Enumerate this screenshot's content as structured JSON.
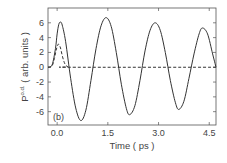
{
  "chart_data": {
    "type": "line",
    "title": "",
    "panel_label": "(b)",
    "xlabel": "Time ( ps )",
    "ylabel": "P",
    "ylabel_superscript": "o.d.",
    "ylabel_suffix": " ( arb. units )",
    "xlim": [
      -0.27,
      4.7
    ],
    "ylim": [
      -7.8,
      8.0
    ],
    "xticks": [
      0.0,
      1.5,
      3.0,
      4.5
    ],
    "xtick_labels": [
      "0.0",
      "1.5",
      "3.0",
      "4.5"
    ],
    "yticks": [
      6,
      4,
      2,
      0,
      -2,
      -4,
      -6
    ],
    "ytick_labels": [
      "6",
      "4",
      "2",
      "0",
      "-2",
      "-4",
      "-6"
    ],
    "grid": false,
    "legend": null,
    "series": [
      {
        "name": "solid",
        "style": "solid",
        "x": [
          -0.27,
          -0.15,
          -0.05,
          0.0,
          0.05,
          0.1,
          0.15,
          0.25,
          0.4,
          0.55,
          0.7,
          0.85,
          1.0,
          1.15,
          1.3,
          1.45,
          1.6,
          1.75,
          1.9,
          2.05,
          2.15,
          2.3,
          2.45,
          2.6,
          2.75,
          2.9,
          3.05,
          3.2,
          3.35,
          3.5,
          3.6,
          3.75,
          3.9,
          4.05,
          4.2,
          4.3,
          4.45,
          4.6,
          4.7
        ],
        "y": [
          0.0,
          0.3,
          2.5,
          4.5,
          5.8,
          6.1,
          5.7,
          3.5,
          -1.5,
          -5.5,
          -7.2,
          -5.8,
          -1.8,
          2.5,
          5.6,
          6.7,
          5.5,
          2.0,
          -2.3,
          -5.6,
          -6.4,
          -5.2,
          -1.8,
          2.2,
          5.0,
          6.0,
          5.0,
          2.0,
          -1.8,
          -4.8,
          -5.7,
          -4.6,
          -1.5,
          1.8,
          4.5,
          5.3,
          4.5,
          1.8,
          0.0
        ]
      },
      {
        "name": "dashed",
        "style": "dashed",
        "x": [
          -0.27,
          -0.15,
          -0.08,
          -0.03,
          0.02,
          0.05,
          0.1,
          0.15,
          0.2,
          0.25,
          0.32,
          0.4,
          4.7
        ],
        "y": [
          0.0,
          0.2,
          1.2,
          2.3,
          3.0,
          3.1,
          2.6,
          1.6,
          0.8,
          0.3,
          0.05,
          0.0,
          0.0
        ]
      }
    ]
  }
}
